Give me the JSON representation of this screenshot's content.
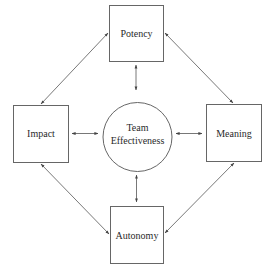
{
  "diagram": {
    "type": "concept-model",
    "center": {
      "id": "team-effectiveness",
      "shape": "circle",
      "label_lines": [
        "Team",
        "Effectiveness"
      ]
    },
    "nodes": [
      {
        "id": "potency",
        "shape": "rect",
        "label": "Potency",
        "position": "top"
      },
      {
        "id": "impact",
        "shape": "rect",
        "label": "Impact",
        "position": "left"
      },
      {
        "id": "meaning",
        "shape": "rect",
        "label": "Meaning",
        "position": "right"
      },
      {
        "id": "autonomy",
        "shape": "rect",
        "label": "Autonomy",
        "position": "bottom"
      }
    ],
    "edges": [
      {
        "from": "potency",
        "to": "team-effectiveness",
        "direction": "bidirectional"
      },
      {
        "from": "impact",
        "to": "team-effectiveness",
        "direction": "bidirectional"
      },
      {
        "from": "meaning",
        "to": "team-effectiveness",
        "direction": "bidirectional"
      },
      {
        "from": "autonomy",
        "to": "team-effectiveness",
        "direction": "bidirectional"
      },
      {
        "from": "potency",
        "to": "impact",
        "direction": "bidirectional"
      },
      {
        "from": "potency",
        "to": "meaning",
        "direction": "bidirectional"
      },
      {
        "from": "impact",
        "to": "autonomy",
        "direction": "bidirectional"
      },
      {
        "from": "meaning",
        "to": "autonomy",
        "direction": "bidirectional"
      }
    ],
    "colors": {
      "stroke": "#555555",
      "text": "#2a2a2a",
      "background": "#ffffff"
    }
  }
}
